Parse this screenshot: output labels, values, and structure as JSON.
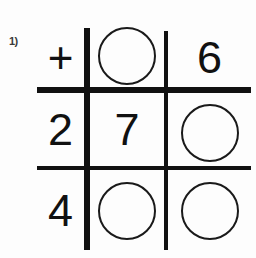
{
  "worksheet": {
    "problem_label": "1)",
    "grid": {
      "rows": [
        [
          {
            "type": "operator",
            "value": "+",
            "name": "plus-operator"
          },
          {
            "type": "circle",
            "value": "",
            "name": "answer-circle"
          },
          {
            "type": "digit",
            "value": "6",
            "name": "digit"
          }
        ],
        [
          {
            "type": "digit",
            "value": "2",
            "name": "digit"
          },
          {
            "type": "digit",
            "value": "7",
            "name": "digit"
          },
          {
            "type": "circle",
            "value": "",
            "name": "answer-circle"
          }
        ],
        [
          {
            "type": "digit",
            "value": "4",
            "name": "digit"
          },
          {
            "type": "circle",
            "value": "",
            "name": "answer-circle"
          },
          {
            "type": "circle",
            "value": "",
            "name": "answer-circle"
          }
        ]
      ]
    },
    "colors": {
      "ink": "#111111",
      "label": "#3a3a3a",
      "paper": "#fdfdfd"
    }
  }
}
